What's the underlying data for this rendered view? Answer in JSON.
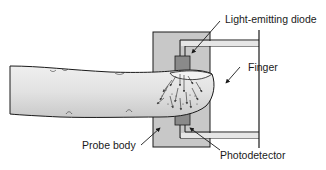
{
  "diagram": {
    "type": "pulse-oximeter-probe",
    "colors": {
      "background": "#ffffff",
      "probe_body": "#c8c8c8",
      "outline": "#1a1a1a",
      "component": "#8a8a8a",
      "finger_fill": "#dedede",
      "arrow": "#333333"
    },
    "labels": {
      "led": "Light-emitting diode",
      "finger": "Finger",
      "probe_body": "Probe body",
      "photodetector": "Photodetector"
    }
  }
}
